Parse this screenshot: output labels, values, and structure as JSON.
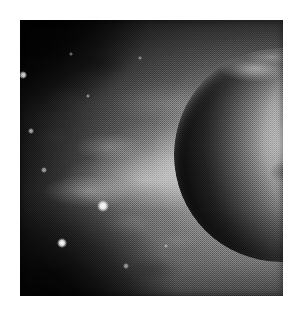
{
  "page": {
    "background_color": "#ffffff",
    "width": 301,
    "height": 315,
    "caption": ""
  },
  "image": {
    "kind": "astronomical-photograph",
    "rendering": "halftone-dithered-grayscale-scan",
    "frame": {
      "x": 20,
      "y": 20,
      "width": 263,
      "height": 276
    },
    "alt_text": "Grayscale halftone photograph of a planet at right partially cut off by the frame, its sunlit limb covered in bright cloud and ice features, a dark terminator crescent along its left limb, with a luminous nebular plume fanning out to the left across a dark star field",
    "palette": {
      "paper": "#ffffff",
      "sky_dark": "#0d0d0d",
      "sky_mid": "#6e6e6e",
      "sky_bright": "#9c9c9c",
      "planet_highlight": "#f2f2f2",
      "planet_midtone": "#7c7c7c",
      "planet_shadow": "#2a2a2a",
      "flare_white": "#ffffff"
    }
  },
  "subjects": {
    "planet": {
      "label": "planet",
      "center_x": 261,
      "center_y": 135,
      "radius": 107,
      "cropped_by_frame": "right",
      "terminator_side": "left",
      "illumination_side": "upper-right"
    },
    "flare": {
      "label": "limb-flare",
      "x": 244,
      "y": 48
    },
    "nebula": {
      "label": "nebular-plume",
      "direction": "left",
      "origin_x": 210,
      "origin_y": 160
    }
  },
  "stars": [
    {
      "x": 23,
      "y": 75,
      "size": 3.0,
      "brightness": 0.95
    },
    {
      "x": 103,
      "y": 206,
      "size": 4.5,
      "brightness": 1.0
    },
    {
      "x": 62,
      "y": 243,
      "size": 4.0,
      "brightness": 1.0
    },
    {
      "x": 31,
      "y": 131,
      "size": 2.0,
      "brightness": 0.65
    },
    {
      "x": 44,
      "y": 170,
      "size": 2.0,
      "brightness": 0.6
    },
    {
      "x": 88,
      "y": 96,
      "size": 1.8,
      "brightness": 0.55
    },
    {
      "x": 140,
      "y": 58,
      "size": 1.8,
      "brightness": 0.5
    },
    {
      "x": 71,
      "y": 54,
      "size": 1.6,
      "brightness": 0.45
    },
    {
      "x": 126,
      "y": 266,
      "size": 2.0,
      "brightness": 0.55
    },
    {
      "x": 166,
      "y": 246,
      "size": 1.8,
      "brightness": 0.48
    }
  ]
}
